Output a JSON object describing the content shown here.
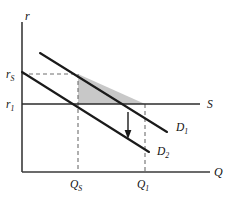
{
  "figure": {
    "type": "economics-supply-demand-diagram",
    "background_color": "#ffffff",
    "line_color": "#1a1a1a",
    "shade_color": "#c3c3c3",
    "dash_color": "#6e6e6e"
  },
  "axes": {
    "y_axis_label": "r",
    "x_axis_label": "Q",
    "origin_px": [
      22,
      172
    ],
    "y_top_px": 22,
    "x_right_px": 210
  },
  "y_ticks": [
    {
      "label": "r",
      "subscript": "S",
      "y_px": 74,
      "name": "r-s"
    },
    {
      "label": "r",
      "subscript": "1",
      "y_px": 104,
      "name": "r-1"
    }
  ],
  "x_ticks": [
    {
      "label": "Q",
      "subscript": "S",
      "x_px": 78,
      "name": "q-s"
    },
    {
      "label": "Q",
      "subscript": "1",
      "x_px": 145,
      "name": "q-1"
    }
  ],
  "curves": [
    {
      "name": "supply-curve",
      "label": "S",
      "subscript": "",
      "kind": "horizontal",
      "points": [
        [
          22,
          104
        ],
        [
          200,
          104
        ]
      ],
      "label_px": [
        207,
        108
      ]
    },
    {
      "name": "demand-curve-1",
      "label": "D",
      "subscript": "1",
      "kind": "downward-sloping",
      "points": [
        [
          40,
          53
        ],
        [
          167,
          132
        ]
      ],
      "label_px": [
        176,
        131
      ]
    },
    {
      "name": "demand-curve-2",
      "label": "D",
      "subscript": "2",
      "kind": "downward-sloping",
      "points": [
        [
          22,
          72
        ],
        [
          149,
          152
        ]
      ],
      "label_px": [
        157,
        155
      ]
    }
  ],
  "shaded_region": {
    "name": "deadweight-triangle",
    "vertices": [
      [
        78,
        74
      ],
      [
        78,
        104
      ],
      [
        145,
        104
      ]
    ],
    "color": "#c3c3c3"
  },
  "guide_lines": [
    {
      "name": "r-s-horizontal-guide",
      "points": [
        [
          22,
          74
        ],
        [
          78,
          74
        ]
      ]
    },
    {
      "name": "q-s-vertical-guide",
      "points": [
        [
          78,
          74
        ],
        [
          78,
          172
        ]
      ]
    },
    {
      "name": "q-1-vertical-guide",
      "points": [
        [
          145,
          104
        ],
        [
          145,
          172
        ]
      ]
    }
  ],
  "annotations": [
    {
      "name": "demand-shift-arrow",
      "kind": "arrow-down",
      "from_px": [
        128,
        112
      ],
      "to_px": [
        128,
        137
      ]
    }
  ]
}
